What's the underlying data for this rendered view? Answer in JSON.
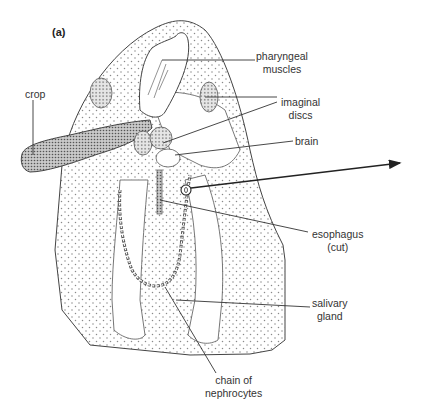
{
  "figure": {
    "panel_label": "(a)",
    "labels": {
      "pharyngeal_muscles": [
        "pharyngeal",
        "muscles"
      ],
      "imaginal_discs": [
        "imaginal",
        "discs"
      ],
      "brain": [
        "brain"
      ],
      "crop": [
        "crop"
      ],
      "esophagus": [
        "esophagus",
        "(cut)"
      ],
      "salivary_gland": [
        "salivary",
        "gland"
      ],
      "nephrocytes": [
        "chain of",
        "nephrocytes"
      ]
    },
    "colors": {
      "outline": "#444444",
      "stipple": "#8a8a8a",
      "dense_fill": "#6e6e6e",
      "text": "#333333"
    }
  }
}
